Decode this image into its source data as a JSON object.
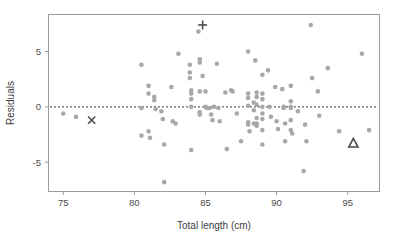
{
  "chart_data": {
    "type": "scatter",
    "title": "",
    "xlabel": "Total length (cm)",
    "ylabel": "Residuals",
    "xlim": [
      74.0,
      97.2
    ],
    "ylim": [
      -7.6,
      8.3
    ],
    "xticks": [
      75,
      80,
      85,
      90,
      95
    ],
    "xticklabels": [
      "75",
      "80",
      "85",
      "90",
      "95"
    ],
    "yticks": [
      5,
      0,
      -5
    ],
    "yticklabels": [
      "5",
      "0",
      "-5"
    ],
    "grid": false,
    "legend": "none",
    "annotations": [
      {
        "type": "hline",
        "y": 0,
        "style": "dotted",
        "label": "zero residual reference line"
      }
    ],
    "series": [
      {
        "name": "residuals",
        "marker": "circle",
        "color": "#a8a8a8",
        "points": [
          [
            75.0,
            -0.6
          ],
          [
            75.9,
            -0.9
          ],
          [
            80.5,
            3.8
          ],
          [
            80.5,
            -0.1
          ],
          [
            80.5,
            -2.6
          ],
          [
            81.0,
            1.9
          ],
          [
            81.0,
            1.2
          ],
          [
            81.0,
            -2.2
          ],
          [
            81.1,
            -2.8
          ],
          [
            81.4,
            0.9
          ],
          [
            81.4,
            0.6
          ],
          [
            81.5,
            -0.2
          ],
          [
            81.9,
            -0.4
          ],
          [
            82.0,
            -1.1
          ],
          [
            82.1,
            -3.4
          ],
          [
            82.1,
            -6.8
          ],
          [
            82.6,
            1.8
          ],
          [
            82.7,
            -1.3
          ],
          [
            82.9,
            -1.5
          ],
          [
            83.1,
            4.8
          ],
          [
            83.9,
            3.8
          ],
          [
            83.9,
            3.1
          ],
          [
            83.9,
            2.6
          ],
          [
            84.0,
            1.5
          ],
          [
            84.0,
            1.2
          ],
          [
            84.0,
            0.7
          ],
          [
            84.0,
            0.0
          ],
          [
            84.0,
            -3.9
          ],
          [
            84.5,
            6.8
          ],
          [
            84.6,
            4.3
          ],
          [
            84.6,
            4.0
          ],
          [
            84.6,
            1.4
          ],
          [
            84.6,
            -0.5
          ],
          [
            84.6,
            -0.7
          ],
          [
            84.8,
            2.8
          ],
          [
            85.0,
            1.4
          ],
          [
            85.0,
            0.0
          ],
          [
            85.1,
            -0.1
          ],
          [
            85.3,
            -0.1
          ],
          [
            85.4,
            -0.7
          ],
          [
            85.5,
            -1.2
          ],
          [
            85.6,
            0.0
          ],
          [
            85.8,
            3.9
          ],
          [
            85.9,
            -0.1
          ],
          [
            86.0,
            -1.3
          ],
          [
            86.4,
            1.3
          ],
          [
            86.5,
            -3.8
          ],
          [
            86.8,
            1.5
          ],
          [
            86.9,
            1.4
          ],
          [
            87.2,
            -0.6
          ],
          [
            87.5,
            -3.1
          ],
          [
            88.0,
            5.0
          ],
          [
            88.0,
            1.2
          ],
          [
            88.0,
            0.8
          ],
          [
            88.0,
            0.1
          ],
          [
            88.0,
            -1.4
          ],
          [
            88.0,
            -1.6
          ],
          [
            88.1,
            -2.2
          ],
          [
            88.4,
            0.4
          ],
          [
            88.4,
            -0.3
          ],
          [
            88.4,
            -1.5
          ],
          [
            88.5,
            4.2
          ],
          [
            88.6,
            1.3
          ],
          [
            88.6,
            0.9
          ],
          [
            88.6,
            0.2
          ],
          [
            88.6,
            -1.0
          ],
          [
            88.6,
            -1.5
          ],
          [
            88.6,
            -1.7
          ],
          [
            89.0,
            2.9
          ],
          [
            89.0,
            1.2
          ],
          [
            89.0,
            0.7
          ],
          [
            89.0,
            0.0
          ],
          [
            89.0,
            -0.6
          ],
          [
            89.0,
            -1.1
          ],
          [
            89.0,
            -2.1
          ],
          [
            89.0,
            -3.4
          ],
          [
            89.4,
            3.3
          ],
          [
            89.5,
            0.0
          ],
          [
            89.6,
            -0.9
          ],
          [
            89.9,
            1.8
          ],
          [
            90.0,
            -1.3
          ],
          [
            90.1,
            -2.0
          ],
          [
            90.4,
            1.6
          ],
          [
            90.5,
            0.0
          ],
          [
            90.5,
            -0.1
          ],
          [
            90.6,
            -1.5
          ],
          [
            90.6,
            -3.1
          ],
          [
            91.0,
            1.9
          ],
          [
            91.0,
            0.5
          ],
          [
            91.0,
            0.0
          ],
          [
            91.0,
            -0.1
          ],
          [
            91.0,
            -1.2
          ],
          [
            91.0,
            -2.1
          ],
          [
            91.1,
            -2.4
          ],
          [
            91.5,
            -0.4
          ],
          [
            91.9,
            -5.8
          ],
          [
            92.0,
            -1.6
          ],
          [
            92.1,
            -3.1
          ],
          [
            92.4,
            7.4
          ],
          [
            92.5,
            2.6
          ],
          [
            92.9,
            1.4
          ],
          [
            93.0,
            -0.8
          ],
          [
            93.6,
            3.5
          ],
          [
            94.4,
            -2.2
          ],
          [
            96.0,
            4.8
          ],
          [
            96.5,
            -2.1
          ]
        ]
      },
      {
        "name": "highlighted-x",
        "marker": "x-cross",
        "color": "#4a4a4a",
        "points": [
          [
            77.0,
            -1.2
          ]
        ]
      },
      {
        "name": "highlighted-plus",
        "marker": "plus",
        "color": "#4a4a4a",
        "points": [
          [
            84.8,
            7.4
          ]
        ]
      },
      {
        "name": "highlighted-triangle",
        "marker": "triangle-up",
        "color": "#4a4a4a",
        "points": [
          [
            95.4,
            -3.3
          ]
        ]
      }
    ]
  }
}
